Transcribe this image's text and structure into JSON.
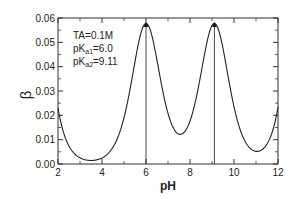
{
  "chart_data": {
    "type": "line",
    "title": "",
    "xlabel": "pH",
    "ylabel": "β",
    "xlim": [
      2,
      12
    ],
    "ylim": [
      0,
      0.06
    ],
    "x_ticks": [
      2,
      4,
      6,
      8,
      10,
      12
    ],
    "x_tick_labels": [
      "2",
      "4",
      "6",
      "8",
      "10",
      "12"
    ],
    "y_ticks": [
      0,
      0.01,
      0.02,
      0.03,
      0.04,
      0.05,
      0.06
    ],
    "y_tick_labels": [
      "0.00",
      "0.01",
      "0.02",
      "0.03",
      "0.04",
      "0.05",
      "0.06"
    ],
    "grid": false,
    "legend": null,
    "annotations": [
      {
        "text": "TA=0.1M"
      },
      {
        "text": "pKa1=6.0",
        "base": "pK",
        "sub": "a1",
        "rest": "=6.0"
      },
      {
        "text": "pKa2=9.11",
        "base": "pK",
        "sub": "a2",
        "rest": "=9.11"
      }
    ],
    "vertical_lines": [
      6.0,
      9.11
    ],
    "peak_markers": [
      {
        "x": 6.0,
        "y": 0.0575
      },
      {
        "x": 9.11,
        "y": 0.0575
      }
    ],
    "model": {
      "TA": 0.1,
      "pKa1": 6.0,
      "pKa2": 9.11,
      "pKw": 14
    },
    "series": [
      {
        "name": "buffer capacity β",
        "x": [
          2.0,
          2.5,
          3.0,
          3.5,
          4.0,
          4.5,
          5.0,
          5.5,
          6.0,
          6.5,
          7.0,
          7.6,
          8.0,
          8.5,
          9.11,
          9.5,
          10.0,
          10.5,
          11.1,
          11.5,
          12.0
        ],
        "values": [
          0.023,
          0.008,
          0.0035,
          0.0022,
          0.003,
          0.0072,
          0.021,
          0.046,
          0.0575,
          0.046,
          0.025,
          0.013,
          0.017,
          0.04,
          0.0575,
          0.05,
          0.025,
          0.009,
          0.0052,
          0.0085,
          0.023
        ]
      }
    ]
  },
  "axis": {
    "x_label": "pH",
    "y_label": "β",
    "x_ticks": [
      "2",
      "4",
      "6",
      "8",
      "10",
      "12"
    ],
    "y_ticks": [
      "0.00",
      "0.01",
      "0.02",
      "0.03",
      "0.04",
      "0.05",
      "0.06"
    ]
  },
  "annotation": {
    "line1": "TA=0.1M",
    "line2_base": "pK",
    "line2_sub": "a1",
    "line2_rest": "=6.0",
    "line3_base": "pK",
    "line3_sub": "a2",
    "line3_rest": "=9.11"
  },
  "colors": {
    "line": "#222222",
    "axis": "#333333",
    "background": "#ffffff"
  }
}
